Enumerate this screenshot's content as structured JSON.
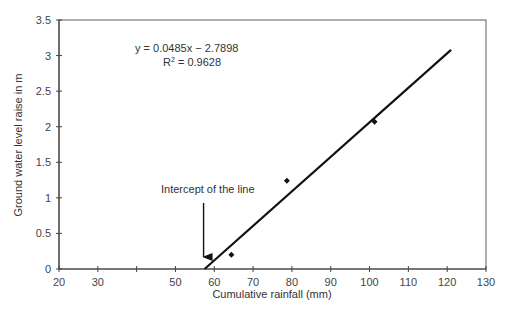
{
  "chart_data": {
    "type": "scatter",
    "title": "",
    "xlabel": "Cumulative rainfall (mm)",
    "ylabel": "Ground water level raise in m",
    "xlim": [
      20,
      130
    ],
    "ylim": [
      0,
      3.5
    ],
    "x_ticks": [
      20,
      30,
      40,
      50,
      60,
      70,
      80,
      90,
      100,
      110,
      120,
      130
    ],
    "x_tick_labels": [
      "20",
      "30",
      "",
      "50",
      "60",
      "70",
      "80",
      "90",
      "100",
      "110",
      "120",
      "130"
    ],
    "y_ticks": [
      0,
      0.5,
      1,
      1.5,
      2,
      2.5,
      3,
      3.5
    ],
    "y_tick_labels": [
      "0",
      "0.5",
      "1",
      "1.5",
      "2",
      "2.5",
      "3",
      "3.5"
    ],
    "grid": false,
    "legend": null,
    "series": [
      {
        "name": "Observed",
        "marker": "diamond",
        "x": [
          64.4,
          78.7,
          101.3
        ],
        "y": [
          0.2,
          1.24,
          2.07
        ]
      },
      {
        "name": "Linear fit",
        "type": "line",
        "x": [
          57.5,
          121.0
        ],
        "y": [
          0.0,
          3.08
        ]
      }
    ],
    "trendline": {
      "equation": "y = 0.0485x − 2.7898",
      "r2_label": "R",
      "r2_sup": "2",
      "r2_value": " = 0.9628",
      "slope": 0.0485,
      "intercept": -2.7898,
      "r2": 0.9628
    },
    "annotations": [
      {
        "text": "Intercept of the line",
        "arrow_to_x": 57.5,
        "arrow_to_y": 0
      }
    ]
  }
}
